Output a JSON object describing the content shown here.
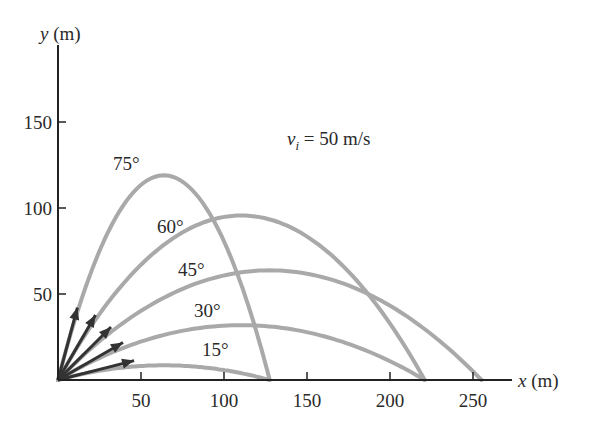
{
  "chart_data": {
    "type": "line",
    "title": "",
    "xlabel": "x (m)",
    "ylabel": "y (m)",
    "xlim": [
      0,
      290
    ],
    "ylim": [
      0,
      180
    ],
    "x_ticks": [
      50,
      100,
      150,
      200,
      250
    ],
    "y_ticks": [
      50,
      100,
      150
    ],
    "grid": false,
    "legend": "inline labels on curves",
    "annotation": {
      "text_var": "v",
      "text_sub": "i",
      "text_rest": " = 50 m/s"
    },
    "initial_speed": 50,
    "g": 9.8,
    "series": [
      {
        "name": "75°",
        "angle": 75,
        "range": 127.6,
        "max_height": 119.0
      },
      {
        "name": "60°",
        "angle": 60,
        "range": 220.9,
        "max_height": 95.7
      },
      {
        "name": "45°",
        "angle": 45,
        "range": 255.1,
        "max_height": 63.8
      },
      {
        "name": "30°",
        "angle": 30,
        "range": 220.9,
        "max_height": 31.9
      },
      {
        "name": "15°",
        "angle": 15,
        "range": 127.6,
        "max_height": 8.5
      }
    ]
  },
  "colors": {
    "curve": "#a9a9a9",
    "axis": "#222222",
    "arrow": "#333333",
    "text": "#2a2a2a"
  }
}
